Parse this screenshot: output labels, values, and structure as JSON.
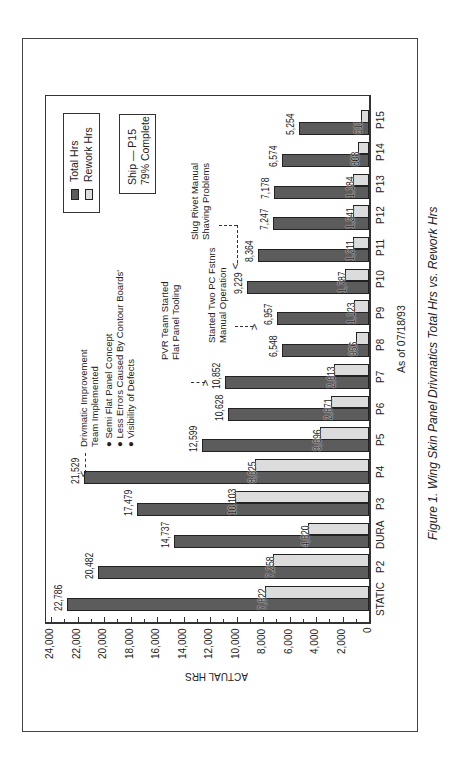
{
  "chart_data": {
    "type": "bar",
    "orientation": "horizontal-rotated",
    "title": "Figure 1. Wing Skin Panel Drivmatics Total Hrs vs. Rework Hrs",
    "subtitle": "As of 07/18/93",
    "xlabel": "",
    "ylabel": "ACTUAL HRS",
    "ylim": [
      0,
      24000
    ],
    "yticks": [
      "0",
      "2,000",
      "4,000",
      "6,000",
      "8,000",
      "10,000",
      "12,000",
      "14,000",
      "16,000",
      "18,000",
      "20,000",
      "22,000",
      "24,000"
    ],
    "categories": [
      "STATIC",
      "P2",
      "DURA",
      "P3",
      "P4",
      "P5",
      "P6",
      "P7",
      "P8",
      "P9",
      "P10",
      "P11",
      "P12",
      "P13",
      "P14",
      "P15"
    ],
    "series": [
      {
        "name": "Total Hrs",
        "color": "#5c5c5c",
        "values": [
          22786,
          20482,
          14737,
          17479,
          21529,
          12599,
          10628,
          10852,
          6548,
          6957,
          9229,
          8364,
          7247,
          7178,
          6574,
          5254
        ],
        "labels": [
          "22,786",
          "20,482",
          "14,737",
          "17,479",
          "21,529",
          "12,599",
          "10,628",
          "10,852",
          "6,548",
          "6,957",
          "9,229",
          "8,364",
          "7,247",
          "7,178",
          "6,574",
          "5,254"
        ]
      },
      {
        "name": "Rework Hrs",
        "color": "#dcdcdc",
        "values": [
          7822,
          7258,
          4620,
          10103,
          8625,
          3696,
          2871,
          2613,
          956,
          1123,
          1787,
          1211,
          1241,
          1184,
          808,
          611
        ],
        "labels": [
          "7,822",
          "7,258",
          "4,620",
          "10,103",
          "8,625",
          "3,696",
          "2,871",
          "2,613",
          "956",
          "1,123",
          "1,787",
          "1,211",
          "1,241",
          "1,184",
          "808",
          "611"
        ]
      }
    ],
    "legend_position": "top-left (rotated)",
    "grid": false,
    "annotations": [
      {
        "target": "P4",
        "lines": [
          "Drivmatic Improvement",
          "Team Implemented"
        ],
        "bullets": [
          "Semi Flat Panel Concept",
          "Less Errors Caused By Contour Boards'",
          "Visibility of Defects"
        ]
      },
      {
        "target": "P7",
        "lines": [
          "PVR Team Started",
          "Flat Panel Tooling"
        ]
      },
      {
        "target": "P8",
        "lines": [
          "Started Two PC Fstnrs",
          "Manual Operation"
        ]
      },
      {
        "target": "P10",
        "lines": [
          "Slug Rivet Manual",
          "Shaving Problems"
        ]
      }
    ]
  },
  "legend": {
    "total": "Total Hrs",
    "rework": "Rework Hrs"
  },
  "status_box": {
    "line1": "Ship — P15",
    "line2": "79% Complete"
  },
  "axis": {
    "label": "ACTUAL HRS",
    "date": "As of 07/18/93"
  },
  "caption": "Figure 1. Wing Skin Panel Drivmatics Total Hrs vs. Rework Hrs",
  "annotations": {
    "drivmatic": {
      "l1": "Drivmatic Improvement",
      "l2": "Team Implemented",
      "b1": "Semi Flat Panel Concept",
      "b2": "Less Errors Caused By Contour Boards'",
      "b3": "Visibility of Defects"
    },
    "pvr": {
      "l1": "PVR Team Started",
      "l2": "Flat Panel Tooling"
    },
    "pc": {
      "l1": "Started Two PC Fstnrs",
      "l2": "Manual Operation"
    },
    "slug": {
      "l1": "Slug Rivet Manual",
      "l2": "Shaving Problems"
    }
  }
}
